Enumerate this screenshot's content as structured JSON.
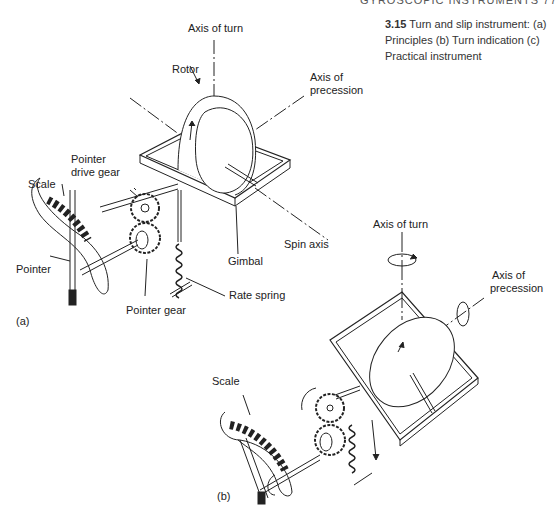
{
  "header": {
    "running_text": "GYROSCOPIC INSTRUMENTS   77"
  },
  "caption": {
    "number": "3.15",
    "text": "Turn and slip instrument: (a) Principles (b) Turn indication (c) Practical instrument"
  },
  "figure_a": {
    "panel_label": "(a)",
    "labels": {
      "axis_of_turn": "Axis of turn",
      "rotor": "Rotor",
      "axis_of_precession_1": "Axis of",
      "axis_of_precession_2": "precession",
      "pointer_drive_gear_1": "Pointer",
      "pointer_drive_gear_2": "drive gear",
      "scale": "Scale",
      "pointer": "Pointer",
      "pointer_gear": "Pointer gear",
      "rate_spring": "Rate spring",
      "gimbal": "Gimbal",
      "spin_axis": "Spin axis"
    }
  },
  "figure_b": {
    "panel_label": "(b)",
    "labels": {
      "axis_of_turn": "Axis of turn",
      "axis_of_precession_1": "Axis of",
      "axis_of_precession_2": "precession",
      "scale": "Scale"
    }
  },
  "colors": {
    "line": "#222222",
    "background": "#ffffff",
    "text": "#222222"
  }
}
